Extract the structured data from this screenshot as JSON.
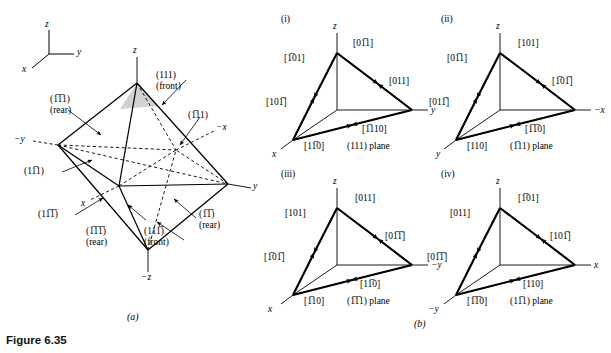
{
  "figure": {
    "caption": "Figure 6.35",
    "part_a_label": "(a)",
    "part_b_label": "(b)"
  },
  "axis_key": {
    "z": "z",
    "y": "y",
    "x": "x"
  },
  "octahedron": {
    "axes": {
      "z": "z",
      "neg_z": "−z",
      "y": "y",
      "neg_y": "−y",
      "x": "x",
      "neg_x": "−x"
    },
    "planes": [
      {
        "name": "plane-111-front",
        "indices": "(111)",
        "h": "1",
        "k": "1",
        "l": "1",
        "note": "(front)"
      },
      {
        "name": "plane-n1n11-rear",
        "indices": "(1̅1̅1)",
        "h": "-1",
        "k": "-1",
        "l": "1",
        "note": "(rear)"
      },
      {
        "name": "plane-n111",
        "indices": "(1̅11)",
        "h": "-1",
        "k": "1",
        "l": "1",
        "note": ""
      },
      {
        "name": "plane-1n11",
        "indices": "(11̅1)",
        "h": "1",
        "k": "-1",
        "l": "1",
        "note": ""
      },
      {
        "name": "plane-1n1n1",
        "indices": "(11̅1̅)",
        "h": "1",
        "k": "-1",
        "l": "-1",
        "note": ""
      },
      {
        "name": "plane-n1n1n1-rear",
        "indices": "(1̅1̅1̅)",
        "h": "-1",
        "k": "-1",
        "l": "-1",
        "note": "(rear)"
      },
      {
        "name": "plane-n11n1-rear",
        "indices": "(1̅1̅)",
        "h": "-1",
        "k": "1",
        "l": "-1",
        "note": "(rear)"
      },
      {
        "name": "plane-11n1-front",
        "indices": "(111̅)",
        "h": "1",
        "k": "1",
        "l": "-1",
        "note": "(front)"
      }
    ]
  },
  "tetrahedra": [
    {
      "id": "(i)",
      "plane_label": "(111) plane",
      "plane": "(111)",
      "axes": {
        "vertical": "z",
        "right": "y",
        "lower_left": "x"
      },
      "directions": [
        {
          "slot": "upper-left",
          "label": "[1̅01]"
        },
        {
          "slot": "upper-right",
          "label": "[01̅1]"
        },
        {
          "slot": "right",
          "label": "[011]"
        },
        {
          "slot": "left",
          "label": "[101̅]"
        },
        {
          "slot": "bottom-left",
          "label": "[11̅0]"
        },
        {
          "slot": "bottom-right",
          "label": "[1̅110]"
        }
      ]
    },
    {
      "id": "(ii)",
      "plane_label": "(1̅11) plane",
      "plane": "(1̅11)",
      "axes": {
        "vertical": "z",
        "right": "−x",
        "lower_left": "y"
      },
      "directions": [
        {
          "slot": "upper-left",
          "label": "[01̅1]"
        },
        {
          "slot": "upper-right",
          "label": "[101]"
        },
        {
          "slot": "right",
          "label": "[1̅01̅]"
        },
        {
          "slot": "left",
          "label": "[011̅]"
        },
        {
          "slot": "bottom-left",
          "label": "[110]"
        },
        {
          "slot": "bottom-right",
          "label": "[1̅1̅0]"
        }
      ]
    },
    {
      "id": "(iii)",
      "plane_label": "(1̅1̅1) plane",
      "plane": "(1̅1̅1)",
      "axes": {
        "vertical": "z",
        "right": "−y",
        "lower_left": "x"
      },
      "directions": [
        {
          "slot": "upper-left",
          "label": "[101]"
        },
        {
          "slot": "upper-right",
          "label": "[011]"
        },
        {
          "slot": "right",
          "label": "[01̅1̅]"
        },
        {
          "slot": "left",
          "label": "[1̅01̅]"
        },
        {
          "slot": "bottom-left",
          "label": "[1̅10]"
        },
        {
          "slot": "bottom-right",
          "label": "[11̅0]"
        }
      ]
    },
    {
      "id": "(iv)",
      "plane_label": "(11̅1) plane",
      "plane": "(11̅1)",
      "axes": {
        "vertical": "z",
        "right": "x",
        "lower_left": "−y"
      },
      "directions": [
        {
          "slot": "upper-left",
          "label": "[011]"
        },
        {
          "slot": "upper-right",
          "label": "[1̅01]"
        },
        {
          "slot": "right",
          "label": "[101̅]"
        },
        {
          "slot": "left",
          "label": "[01̅1̅]"
        },
        {
          "slot": "bottom-left",
          "label": "[1̅1̅0]"
        },
        {
          "slot": "bottom-right",
          "label": "[110]"
        }
      ]
    }
  ]
}
